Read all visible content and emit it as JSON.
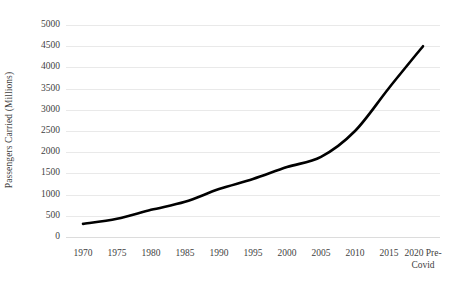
{
  "chart_data": {
    "type": "line",
    "title": "",
    "xlabel": "",
    "ylabel": "Passengers Carried (Millions)",
    "categories": [
      "1970",
      "1975",
      "1980",
      "1985",
      "1990",
      "1995",
      "2000",
      "2005",
      "2010",
      "2015",
      "2020 Pre-Covid"
    ],
    "x_tick_labels": [
      {
        "line1": "1970",
        "line2": ""
      },
      {
        "line1": "1975",
        "line2": ""
      },
      {
        "line1": "1980",
        "line2": ""
      },
      {
        "line1": "1985",
        "line2": ""
      },
      {
        "line1": "1990",
        "line2": ""
      },
      {
        "line1": "1995",
        "line2": ""
      },
      {
        "line1": "2000",
        "line2": ""
      },
      {
        "line1": "2005",
        "line2": ""
      },
      {
        "line1": "2010",
        "line2": ""
      },
      {
        "line1": "2015",
        "line2": ""
      },
      {
        "line1": "2020 Pre-",
        "line2": "Covid"
      }
    ],
    "values": [
      310,
      430,
      640,
      830,
      1130,
      1370,
      1650,
      1890,
      2500,
      3515,
      4500
    ],
    "series": [
      {
        "name": "Passengers Carried",
        "color": "#000000",
        "values": [
          310,
          430,
          640,
          830,
          1130,
          1370,
          1650,
          1890,
          2500,
          3515,
          4500
        ]
      }
    ],
    "y_tick_labels": [
      "5000",
      "4500",
      "4000",
      "3500",
      "3000",
      "2500",
      "2000",
      "1500",
      "1000",
      "500",
      "0"
    ],
    "y_tick_values": [
      5000,
      4500,
      4000,
      3500,
      3000,
      2500,
      2000,
      1500,
      1000,
      500,
      0
    ],
    "ylim": [
      0,
      5000
    ],
    "grid": "horizontal",
    "legend": "none",
    "line_width_px": 2.6,
    "grid_color": "#e9e9e9",
    "text_color": "#3f3f3f",
    "background": "#ffffff"
  }
}
